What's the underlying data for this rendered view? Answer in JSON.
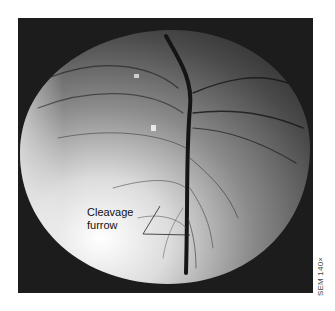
{
  "figure": {
    "annotation": {
      "line1": "Cleavage",
      "line2": "furrow"
    },
    "credit": "SEM 140×"
  },
  "colors": {
    "background": "#ffffff",
    "frame": "#1c1c1c",
    "sphere_light": "#f2f2f2",
    "sphere_dark": "#3a3a3a"
  }
}
